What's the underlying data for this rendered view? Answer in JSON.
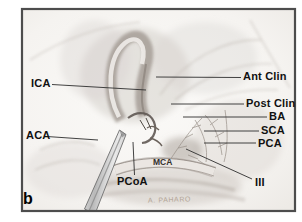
{
  "figure": {
    "panel_label": "b",
    "artist_signature": "A. PAHARO"
  },
  "labels": {
    "ica": "ICA",
    "aca": "ACA",
    "pcoa": "PCoA",
    "mca": "MCA",
    "ant_clin": "Ant Clin",
    "post_clin": "Post Clin",
    "ba": "BA",
    "sca": "SCA",
    "pca": "PCA",
    "iii": "III"
  },
  "colors": {
    "frame_border": "#4d4d4d",
    "label_text": "#111111",
    "leader_line": "#2e2e2e",
    "paper": "#f7f5f3"
  }
}
